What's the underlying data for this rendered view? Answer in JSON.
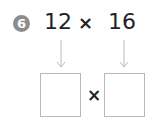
{
  "problem": {
    "number": "6",
    "left_operand": "12",
    "operator": "×",
    "right_operand": "16"
  },
  "answer": {
    "left_box_value": "",
    "operator": "×",
    "right_box_value": ""
  },
  "colors": {
    "badge": "#8c8c8c",
    "text": "#222222",
    "box_border": "#b8b8b8",
    "arrow": "#bbbbbb"
  }
}
